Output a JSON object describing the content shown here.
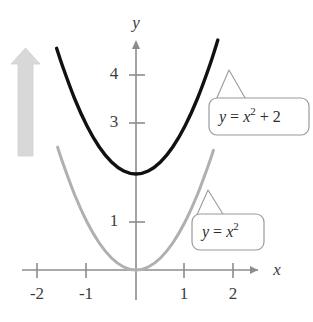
{
  "figure": {
    "kind": "coordinate-plane-graph",
    "background_color": "#ffffff",
    "axes": {
      "x_axis_label": "x",
      "y_axis_label": "y",
      "axis_color": "#8c8c8c",
      "x_tick_labels": [
        "-2",
        "-1",
        "1",
        "2"
      ],
      "x_tick_values": [
        -2,
        -1,
        1,
        2
      ],
      "y_tick_labels": [
        "4",
        "3",
        "1"
      ],
      "y_tick_values": [
        4,
        3,
        1
      ],
      "x_range": [
        -2.35,
        2.6
      ],
      "y_range": [
        -0.6,
        4.9
      ]
    },
    "arrow": {
      "name": "vertical-shift-arrow",
      "direction": "up",
      "color": "#d4d4d4"
    },
    "curves": [
      {
        "id": "upper",
        "equation_text": "y = x² + 2",
        "color": "#111111",
        "stroke_width": 3.4,
        "coefficient": 1,
        "vertical_shift": 2,
        "x_domain": [
          -1.62,
          1.67
        ],
        "points": [
          [
            -1.62,
            4.62
          ],
          [
            -1.5,
            4.25
          ],
          [
            -1.25,
            3.5625
          ],
          [
            -1.0,
            3.0
          ],
          [
            -0.75,
            2.5625
          ],
          [
            -0.5,
            2.25
          ],
          [
            -0.25,
            2.0625
          ],
          [
            0,
            2.0
          ],
          [
            0.25,
            2.0625
          ],
          [
            0.5,
            2.25
          ],
          [
            0.75,
            2.5625
          ],
          [
            1.0,
            3.0
          ],
          [
            1.25,
            3.5625
          ],
          [
            1.5,
            4.25
          ],
          [
            1.67,
            4.79
          ]
        ]
      },
      {
        "id": "lower",
        "equation_text": "y = x²",
        "color": "#b0b0b0",
        "stroke_width": 3.0,
        "coefficient": 1,
        "vertical_shift": 0,
        "x_domain": [
          -1.6,
          1.58
        ],
        "points": [
          [
            -1.6,
            2.56
          ],
          [
            -1.5,
            2.25
          ],
          [
            -1.25,
            1.5625
          ],
          [
            -1.0,
            1.0
          ],
          [
            -0.75,
            0.5625
          ],
          [
            -0.5,
            0.25
          ],
          [
            -0.25,
            0.0625
          ],
          [
            0,
            0
          ],
          [
            0.25,
            0.0625
          ],
          [
            0.5,
            0.25
          ],
          [
            0.75,
            0.5625
          ],
          [
            1.0,
            1.0
          ],
          [
            1.25,
            1.5625
          ],
          [
            1.5,
            2.25
          ],
          [
            1.58,
            2.4964
          ]
        ]
      }
    ],
    "callouts": [
      {
        "id": "callout-upper",
        "lhs": "y",
        "eq": " = ",
        "base": "x",
        "exponent": "2",
        "tail": " + 2",
        "full_text": "y = x² + 2",
        "border_color": "#9a9a9a",
        "fill_color": "#ffffff"
      },
      {
        "id": "callout-lower",
        "lhs": "y",
        "eq": " = ",
        "base": "x",
        "exponent": "2",
        "tail": "",
        "full_text": "y = x²",
        "border_color": "#9a9a9a",
        "fill_color": "#ffffff"
      }
    ]
  },
  "chart_data": {
    "type": "line",
    "title": "",
    "xlabel": "x",
    "ylabel": "y",
    "xlim": [
      -2.35,
      2.6
    ],
    "ylim": [
      -0.6,
      4.9
    ],
    "grid": false,
    "legend": "callout-labels",
    "xticks": [
      -2,
      -1,
      1,
      2
    ],
    "yticks": [
      4,
      3,
      1
    ],
    "series": [
      {
        "name": "y = x² + 2",
        "color": "#111111",
        "x": [
          -1.62,
          -1.5,
          -1.25,
          -1.0,
          -0.75,
          -0.5,
          -0.25,
          0,
          0.25,
          0.5,
          0.75,
          1.0,
          1.25,
          1.5,
          1.67
        ],
        "values": [
          4.62,
          4.25,
          3.5625,
          3.0,
          2.5625,
          2.25,
          2.0625,
          2.0,
          2.0625,
          2.25,
          2.5625,
          3.0,
          3.5625,
          4.25,
          4.79
        ]
      },
      {
        "name": "y = x²",
        "color": "#b0b0b0",
        "x": [
          -1.6,
          -1.5,
          -1.25,
          -1.0,
          -0.75,
          -0.5,
          -0.25,
          0,
          0.25,
          0.5,
          0.75,
          1.0,
          1.25,
          1.5,
          1.58
        ],
        "values": [
          2.56,
          2.25,
          1.5625,
          1.0,
          0.5625,
          0.25,
          0.0625,
          0,
          0.0625,
          0.25,
          0.5625,
          1.0,
          1.5625,
          2.25,
          2.4964
        ]
      }
    ],
    "annotations": [
      {
        "text": "y = x² + 2",
        "kind": "callout"
      },
      {
        "text": "y = x²",
        "kind": "callout"
      },
      {
        "text": "upward shift arrow",
        "kind": "arrow"
      }
    ]
  }
}
